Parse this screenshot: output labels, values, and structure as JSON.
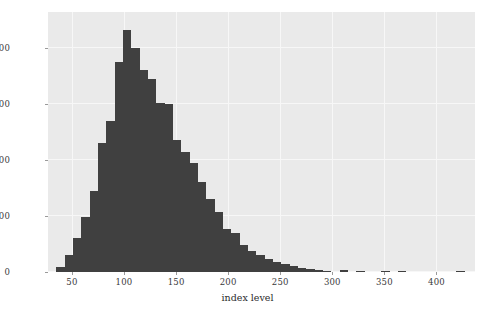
{
  "chart_data": {
    "type": "bar",
    "title": "",
    "subtitle": "",
    "xlabel": "index level",
    "ylabel": "frequency",
    "xlim": [
      27,
      437
    ],
    "ylim": [
      0,
      928
    ],
    "grid": true,
    "legend": null,
    "bar_color": "#404040",
    "plot_background": "#eaeaea",
    "gridline_color": "#f7f7f7",
    "figure_background": "#ffffff",
    "xticks": [
      50,
      100,
      150,
      200,
      250,
      300,
      350,
      400
    ],
    "xtick_labels": [
      "50",
      "100",
      "150",
      "200",
      "250",
      "300",
      "350",
      "400"
    ],
    "yticks": [
      0,
      200,
      400,
      600,
      800
    ],
    "ytick_labels": [
      "0",
      "200",
      "400",
      "600",
      "800"
    ],
    "bin_width": 8,
    "bin_starts": [
      27,
      35,
      43,
      51,
      59,
      67,
      75,
      83,
      91,
      99,
      107,
      115,
      123,
      131,
      139,
      147,
      155,
      163,
      171,
      179,
      187,
      195,
      203,
      211,
      219,
      227,
      235,
      243,
      251,
      259,
      267,
      275,
      283,
      291,
      299,
      307,
      315,
      323,
      331,
      339,
      347,
      355,
      363,
      371,
      379,
      387,
      395,
      403,
      411,
      419,
      427
    ],
    "categories": [
      "27-35",
      "35-43",
      "43-51",
      "51-59",
      "59-67",
      "67-75",
      "75-83",
      "83-91",
      "91-99",
      "99-107",
      "107-115",
      "115-123",
      "123-131",
      "131-139",
      "139-147",
      "147-155",
      "155-163",
      "163-171",
      "171-179",
      "179-187",
      "187-195",
      "195-203",
      "203-211",
      "211-219",
      "219-227",
      "227-235",
      "235-243",
      "243-251",
      "251-259",
      "259-267",
      "267-275",
      "275-283",
      "283-291",
      "291-299",
      "299-307",
      "307-315",
      "315-323",
      "323-331",
      "331-339",
      "339-347",
      "347-355",
      "355-363",
      "363-371",
      "371-379",
      "379-387",
      "387-395",
      "395-403",
      "403-411",
      "411-419",
      "419-427",
      "427-435"
    ],
    "values": [
      0,
      18,
      60,
      120,
      195,
      290,
      460,
      540,
      750,
      865,
      800,
      720,
      690,
      605,
      600,
      470,
      430,
      390,
      320,
      260,
      215,
      155,
      140,
      95,
      75,
      62,
      48,
      36,
      28,
      21,
      15,
      10,
      6,
      3,
      0,
      6,
      0,
      4,
      0,
      0,
      3,
      0,
      4,
      0,
      0,
      0,
      0,
      0,
      0,
      4,
      0
    ],
    "peak": {
      "bin": "99-107",
      "value": 865
    }
  }
}
